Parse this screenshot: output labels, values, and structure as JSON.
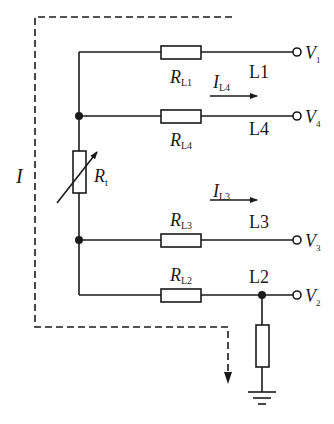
{
  "diagram": {
    "type": "circuit-schematic",
    "current_loop_label": "I",
    "variable_resistor": {
      "symbol": "R",
      "subscript": "t"
    },
    "branches": [
      {
        "id": "L1",
        "line_label": "L1",
        "resistor": {
          "symbol": "R",
          "subscript": "L1"
        },
        "terminal": {
          "symbol": "V",
          "subscript": "1"
        }
      },
      {
        "id": "L4",
        "line_label": "L4",
        "resistor": {
          "symbol": "R",
          "subscript": "L4"
        },
        "terminal": {
          "symbol": "V",
          "subscript": "4"
        },
        "current": {
          "symbol": "I",
          "subscript": "L4"
        }
      },
      {
        "id": "L3",
        "line_label": "L3",
        "resistor": {
          "symbol": "R",
          "subscript": "L3"
        },
        "terminal": {
          "symbol": "V",
          "subscript": "3"
        },
        "current": {
          "symbol": "I",
          "subscript": "L3"
        }
      },
      {
        "id": "L2",
        "line_label": "L2",
        "resistor": {
          "symbol": "R",
          "subscript": "L2"
        },
        "terminal": {
          "symbol": "V",
          "subscript": "2"
        }
      }
    ],
    "ground": "ground-symbol",
    "colors": {
      "line": "#1a1a1a",
      "background": "#ffffff"
    }
  }
}
